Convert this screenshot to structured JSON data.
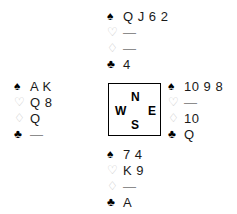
{
  "diagram": {
    "type": "bridge-hand-diagram",
    "suits": [
      {
        "key": "spades",
        "symbol": "♠",
        "style": "black"
      },
      {
        "key": "hearts",
        "symbol": "♡",
        "style": "hollow"
      },
      {
        "key": "diamonds",
        "symbol": "♢",
        "style": "hollow"
      },
      {
        "key": "clubs",
        "symbol": "♣",
        "style": "black"
      }
    ],
    "void_marker": "—",
    "compass": {
      "north": "N",
      "west": "W",
      "east": "E",
      "south": "S"
    },
    "hands": {
      "north": {
        "label": "North",
        "spades": "Q J 6 2",
        "hearts": "—",
        "diamonds": "—",
        "clubs": "4"
      },
      "west": {
        "label": "West",
        "spades": "A K",
        "hearts": "Q 8",
        "diamonds": "Q",
        "clubs": "—"
      },
      "east": {
        "label": "East",
        "spades": "10 9 8",
        "hearts": "—",
        "diamonds": "10",
        "clubs": "Q"
      },
      "south": {
        "label": "South",
        "spades": "7 4",
        "hearts": "K 9",
        "diamonds": "—",
        "clubs": "A"
      }
    }
  }
}
